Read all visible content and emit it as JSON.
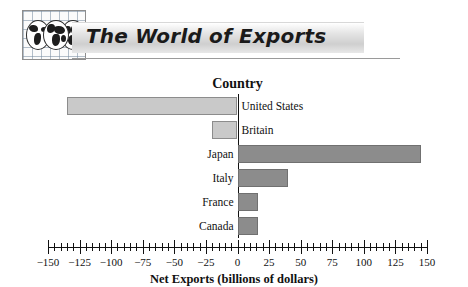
{
  "header": {
    "title": "The World of Exports",
    "logo_icon": "globes-grid-icon"
  },
  "chart_data": {
    "type": "bar",
    "orientation": "horizontal",
    "title": "Net Exports (billions of dollars)",
    "category_heading": "Country",
    "categories": [
      "United States",
      "Britain",
      "Japan",
      "Italy",
      "France",
      "Canada"
    ],
    "values": [
      -135,
      -20,
      145,
      40,
      16,
      16
    ],
    "xlabel": "Net Exports (billions of dollars)",
    "ylabel": "Country",
    "xlim": [
      -150,
      150
    ],
    "xticks": [
      -150,
      -125,
      -100,
      -75,
      -50,
      -25,
      0,
      25,
      50,
      75,
      100,
      125,
      150
    ],
    "xtick_labels": [
      "−150",
      "−125",
      "−100",
      "−75",
      "−50",
      "−25",
      "0",
      "25",
      "50",
      "75",
      "100",
      "125",
      "150"
    ],
    "minor_tick_step": 5,
    "grid": false,
    "legend": false,
    "colors": {
      "negative_bar": "#c9c9c9",
      "positive_bar": "#8c8c8c",
      "axis": "#111111",
      "banner_text": "#1a1a1a"
    }
  }
}
